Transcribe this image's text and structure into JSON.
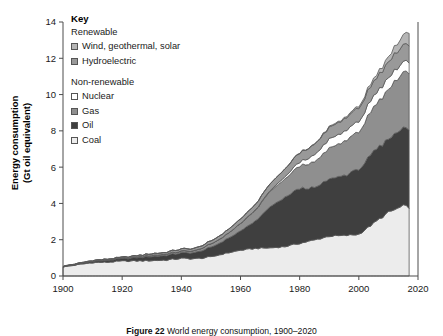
{
  "chart_data": {
    "type": "area",
    "title": "",
    "xlabel": "Year",
    "ylabel": "Energy consumption\n(Gt oil equivalent)",
    "ylabel_line1": "Energy consumption",
    "ylabel_line2": "(Gt oil equivalent)",
    "xlim": [
      1900,
      2020
    ],
    "ylim": [
      0,
      14
    ],
    "xticks": [
      1900,
      1920,
      1940,
      1960,
      1980,
      2000,
      2020
    ],
    "yticks": [
      0,
      2,
      4,
      6,
      8,
      10,
      12,
      14
    ],
    "grid": false,
    "stacked": true,
    "stack_order_bottom_to_top": [
      "Coal",
      "Oil",
      "Gas",
      "Nuclear",
      "Hydroelectric",
      "Wind, geothermal, solar"
    ],
    "x": [
      1900,
      1905,
      1910,
      1915,
      1920,
      1925,
      1930,
      1935,
      1940,
      1945,
      1950,
      1955,
      1960,
      1965,
      1970,
      1975,
      1980,
      1985,
      1990,
      1995,
      2000,
      2005,
      2010,
      2015,
      2017
    ],
    "series": [
      {
        "name": "Coal",
        "color": "#ececec",
        "values": [
          0.5,
          0.62,
          0.74,
          0.76,
          0.82,
          0.83,
          0.85,
          0.88,
          0.97,
          0.95,
          1.05,
          1.25,
          1.42,
          1.52,
          1.55,
          1.62,
          1.8,
          1.98,
          2.2,
          2.22,
          2.3,
          2.9,
          3.5,
          3.85,
          3.8
        ]
      },
      {
        "name": "Oil",
        "color": "#3f3f3f",
        "values": [
          0.02,
          0.04,
          0.07,
          0.1,
          0.13,
          0.18,
          0.23,
          0.26,
          0.31,
          0.34,
          0.52,
          0.75,
          1.05,
          1.5,
          2.25,
          2.7,
          3.05,
          2.85,
          3.15,
          3.3,
          3.6,
          3.9,
          4.05,
          4.3,
          4.4
        ]
      },
      {
        "name": "Gas",
        "color": "#8f8f8f",
        "values": [
          0.01,
          0.01,
          0.02,
          0.03,
          0.03,
          0.04,
          0.06,
          0.07,
          0.09,
          0.11,
          0.18,
          0.25,
          0.4,
          0.58,
          0.85,
          1.0,
          1.25,
          1.4,
          1.7,
          1.85,
          2.1,
          2.4,
          2.75,
          3.05,
          3.15
        ]
      },
      {
        "name": "Nuclear",
        "color": "#ffffff",
        "values": [
          0,
          0,
          0,
          0,
          0,
          0,
          0,
          0,
          0,
          0,
          0,
          0,
          0.01,
          0.02,
          0.05,
          0.12,
          0.22,
          0.38,
          0.5,
          0.55,
          0.58,
          0.62,
          0.63,
          0.58,
          0.6
        ]
      },
      {
        "name": "Hydroelectric",
        "color": "#999999",
        "values": [
          0.01,
          0.02,
          0.03,
          0.04,
          0.05,
          0.07,
          0.09,
          0.1,
          0.12,
          0.13,
          0.16,
          0.2,
          0.25,
          0.3,
          0.37,
          0.43,
          0.5,
          0.57,
          0.64,
          0.69,
          0.74,
          0.8,
          0.88,
          0.93,
          0.95
        ]
      },
      {
        "name": "Wind, geothermal, solar",
        "color": "#b5b5b5",
        "values": [
          0,
          0,
          0,
          0,
          0,
          0,
          0,
          0,
          0,
          0,
          0,
          0,
          0,
          0,
          0.01,
          0.01,
          0.02,
          0.03,
          0.04,
          0.06,
          0.09,
          0.15,
          0.28,
          0.55,
          0.7
        ]
      }
    ]
  },
  "legend": {
    "heading": "Key",
    "groups": [
      {
        "title": "Renewable",
        "items": [
          {
            "label": "Wind, geothermal, solar",
            "color": "#b5b5b5"
          },
          {
            "label": "Hydroelectric",
            "color": "#999999"
          }
        ]
      },
      {
        "title": "Non-renewable",
        "items": [
          {
            "label": "Nuclear",
            "color": "#ffffff"
          },
          {
            "label": "Gas",
            "color": "#8f8f8f"
          },
          {
            "label": "Oil",
            "color": "#3f3f3f"
          },
          {
            "label": "Coal",
            "color": "#ececec"
          }
        ]
      }
    ]
  },
  "caption": {
    "figure_label": "Figure 22",
    "text": "World energy consumption, 1900–2020"
  }
}
